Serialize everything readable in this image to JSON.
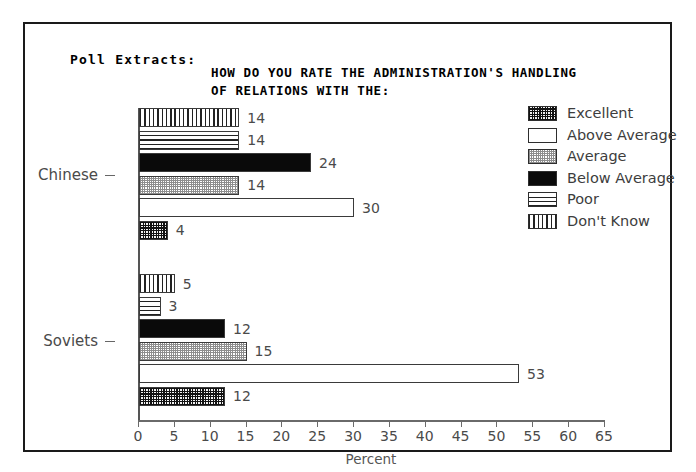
{
  "header": {
    "poll_label": "Poll Extracts:",
    "title_line1": "HOW DO YOU RATE THE ADMINISTRATION'S HANDLING",
    "title_line2": "OF RELATIONS WITH THE:"
  },
  "legend": {
    "position": "right",
    "items": [
      {
        "label": "Excellent",
        "pattern": "crosshatch-dark"
      },
      {
        "label": "Above Average",
        "pattern": "white"
      },
      {
        "label": "Average",
        "pattern": "stipple-light"
      },
      {
        "label": "Below Average",
        "pattern": "solid-black"
      },
      {
        "label": "Poor",
        "pattern": "horizontal-lines"
      },
      {
        "label": "Don't Know",
        "pattern": "vertical-lines"
      }
    ]
  },
  "chart_data": {
    "type": "bar",
    "orientation": "horizontal",
    "title": "HOW DO YOU RATE THE ADMINISTRATION'S HANDLING OF RELATIONS WITH THE:",
    "xlabel": "Percent",
    "ylabel": "",
    "categories": [
      "Chinese",
      "Soviets"
    ],
    "series": [
      {
        "name": "Excellent",
        "values": [
          4,
          12
        ]
      },
      {
        "name": "Above Average",
        "values": [
          30,
          53
        ]
      },
      {
        "name": "Average",
        "values": [
          14,
          15
        ]
      },
      {
        "name": "Below Average",
        "values": [
          24,
          12
        ]
      },
      {
        "name": "Poor",
        "values": [
          14,
          3
        ]
      },
      {
        "name": "Don't Know",
        "values": [
          14,
          5
        ]
      }
    ],
    "xlim": [
      0,
      65
    ],
    "xticks": [
      0,
      5,
      10,
      15,
      20,
      25,
      30,
      35,
      40,
      45,
      50,
      55,
      60,
      65
    ],
    "grid": false,
    "data_labels": true
  }
}
